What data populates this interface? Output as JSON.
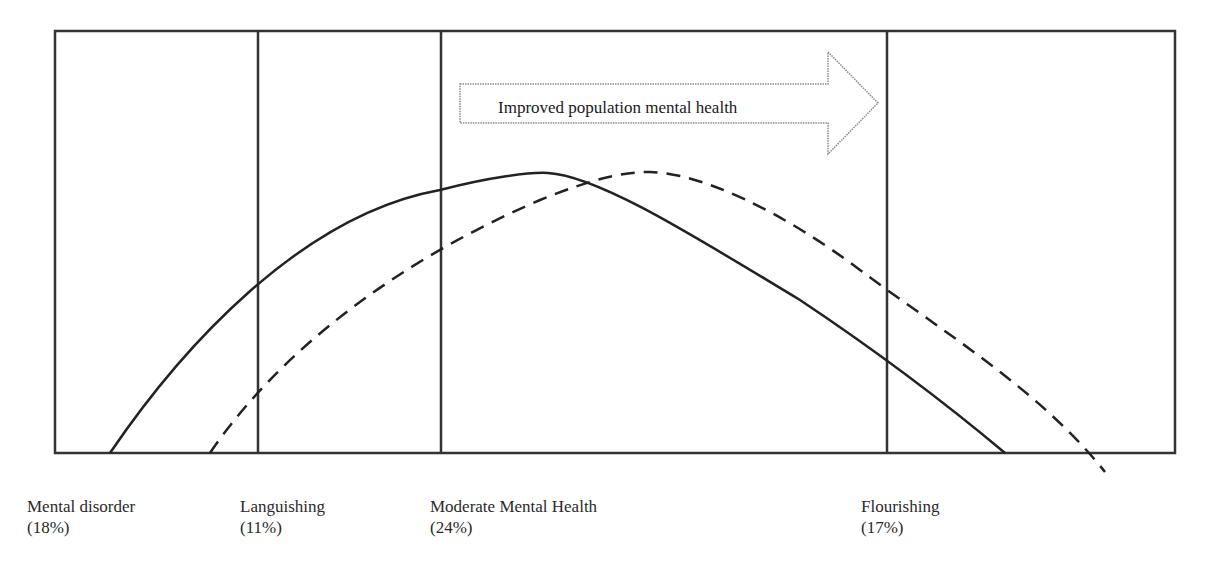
{
  "diagram": {
    "arrow": {
      "label": "Improved population mental health",
      "direction": "right"
    },
    "categories": [
      {
        "name": "Mental disorder",
        "percent": "(18%)"
      },
      {
        "name": "Languishing",
        "percent": "(11%)"
      },
      {
        "name": "Moderate Mental Health",
        "percent": "(24%)"
      },
      {
        "name": "Flourishing",
        "percent": "(17%)"
      }
    ],
    "curves": [
      {
        "name": "current-distribution",
        "style": "solid"
      },
      {
        "name": "shifted-distribution",
        "style": "dashed"
      }
    ],
    "colors": {
      "line": "#222222",
      "arrow_border": "#8a8a8a",
      "text": "#2a2a2a"
    }
  }
}
